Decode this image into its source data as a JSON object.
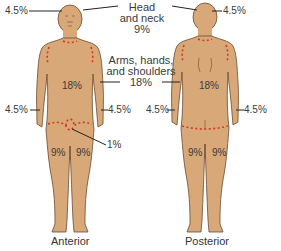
{
  "colors": {
    "skin": "#d8a878",
    "outline": "#6b4a2e",
    "dash": "#d43a1a",
    "leader": "#222222",
    "text": "#3a3a3a",
    "background": "#ffffff"
  },
  "labels": {
    "head_neck": {
      "line1": "Head",
      "line2": "and neck",
      "value": "9%"
    },
    "arms": {
      "line1": "Arms, hands,",
      "line2": "and shoulders",
      "value": "18%"
    },
    "anterior": {
      "head": "4.5%",
      "trunk": "18%",
      "left_arm": "4.5%",
      "right_arm": "4.5%",
      "genitals": "1%",
      "left_leg": "9%",
      "right_leg": "9%",
      "caption": "Anterior"
    },
    "posterior": {
      "head": "4.5%",
      "trunk": "18%",
      "left_arm": "4.5%",
      "right_arm": "4.5%",
      "left_leg": "9%",
      "right_leg": "9%",
      "caption": "Posterior"
    }
  }
}
